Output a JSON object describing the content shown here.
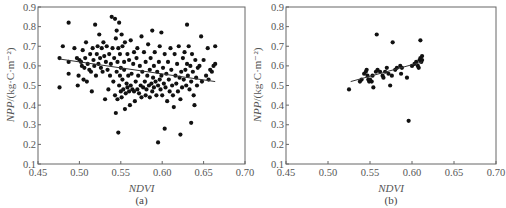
{
  "chart_data": [
    {
      "type": "scatter",
      "panel_label": "(a)",
      "xlabel": "NDVI",
      "ylabel_italic": "NPP",
      "ylabel_rest": "/(kg·C·m⁻²)",
      "xlim": [
        0.45,
        0.7
      ],
      "ylim": [
        0.1,
        0.9
      ],
      "xticks": [
        "0.45",
        "0.50",
        "0.55",
        "0.60",
        "0.65",
        "0.70"
      ],
      "yticks": [
        "0.1",
        "0.2",
        "0.3",
        "0.4",
        "0.5",
        "0.6",
        "0.7",
        "0.8",
        "0.9"
      ],
      "grid": false,
      "trendline": {
        "x": [
          0.476,
          0.664
        ],
        "y": [
          0.635,
          0.52
        ]
      },
      "points": [
        [
          0.476,
          0.64
        ],
        [
          0.476,
          0.49
        ],
        [
          0.48,
          0.7
        ],
        [
          0.487,
          0.82
        ],
        [
          0.487,
          0.62
        ],
        [
          0.487,
          0.56
        ],
        [
          0.494,
          0.69
        ],
        [
          0.497,
          0.64
        ],
        [
          0.498,
          0.5
        ],
        [
          0.499,
          0.55
        ],
        [
          0.5,
          0.63
        ],
        [
          0.502,
          0.62
        ],
        [
          0.503,
          0.6
        ],
        [
          0.504,
          0.68
        ],
        [
          0.505,
          0.53
        ],
        [
          0.506,
          0.59
        ],
        [
          0.507,
          0.64
        ],
        [
          0.508,
          0.72
        ],
        [
          0.509,
          0.52
        ],
        [
          0.51,
          0.61
        ],
        [
          0.512,
          0.58
        ],
        [
          0.513,
          0.66
        ],
        [
          0.514,
          0.57
        ],
        [
          0.515,
          0.47
        ],
        [
          0.516,
          0.69
        ],
        [
          0.517,
          0.63
        ],
        [
          0.518,
          0.6
        ],
        [
          0.519,
          0.81
        ],
        [
          0.52,
          0.55
        ],
        [
          0.521,
          0.66
        ],
        [
          0.522,
          0.7
        ],
        [
          0.523,
          0.61
        ],
        [
          0.524,
          0.76
        ],
        [
          0.525,
          0.64
        ],
        [
          0.526,
          0.59
        ],
        [
          0.527,
          0.69
        ],
        [
          0.528,
          0.57
        ],
        [
          0.529,
          0.72
        ],
        [
          0.53,
          0.65
        ],
        [
          0.531,
          0.43
        ],
        [
          0.532,
          0.62
        ],
        [
          0.533,
          0.7
        ],
        [
          0.534,
          0.58
        ],
        [
          0.535,
          0.48
        ],
        [
          0.536,
          0.66
        ],
        [
          0.537,
          0.55
        ],
        [
          0.538,
          0.61
        ],
        [
          0.539,
          0.85
        ],
        [
          0.54,
          0.69
        ],
        [
          0.541,
          0.52
        ],
        [
          0.542,
          0.64
        ],
        [
          0.543,
          0.84
        ],
        [
          0.543,
          0.45
        ],
        [
          0.544,
          0.36
        ],
        [
          0.544,
          0.74
        ],
        [
          0.545,
          0.57
        ],
        [
          0.545,
          0.78
        ],
        [
          0.546,
          0.62
        ],
        [
          0.546,
          0.43
        ],
        [
          0.547,
          0.26
        ],
        [
          0.547,
          0.69
        ],
        [
          0.548,
          0.82
        ],
        [
          0.548,
          0.5
        ],
        [
          0.549,
          0.55
        ],
        [
          0.549,
          0.66
        ],
        [
          0.55,
          0.59
        ],
        [
          0.55,
          0.47
        ],
        [
          0.551,
          0.76
        ],
        [
          0.551,
          0.44
        ],
        [
          0.552,
          0.53
        ],
        [
          0.552,
          0.7
        ],
        [
          0.553,
          0.48
        ],
        [
          0.554,
          0.62
        ],
        [
          0.554,
          0.58
        ],
        [
          0.555,
          0.38
        ],
        [
          0.555,
          0.72
        ],
        [
          0.556,
          0.46
        ],
        [
          0.557,
          0.51
        ],
        [
          0.558,
          0.66
        ],
        [
          0.558,
          0.49
        ],
        [
          0.559,
          0.55
        ],
        [
          0.56,
          0.63
        ],
        [
          0.56,
          0.47
        ],
        [
          0.561,
          0.4
        ],
        [
          0.562,
          0.73
        ],
        [
          0.562,
          0.5
        ],
        [
          0.563,
          0.56
        ],
        [
          0.564,
          0.48
        ],
        [
          0.565,
          0.61
        ],
        [
          0.566,
          0.67
        ],
        [
          0.566,
          0.47
        ],
        [
          0.567,
          0.42
        ],
        [
          0.568,
          0.52
        ],
        [
          0.569,
          0.64
        ],
        [
          0.57,
          0.48
        ],
        [
          0.57,
          0.69
        ],
        [
          0.571,
          0.55
        ],
        [
          0.572,
          0.46
        ],
        [
          0.573,
          0.6
        ],
        [
          0.574,
          0.5
        ],
        [
          0.575,
          0.75
        ],
        [
          0.575,
          0.44
        ],
        [
          0.576,
          0.57
        ],
        [
          0.577,
          0.49
        ],
        [
          0.578,
          0.67
        ],
        [
          0.579,
          0.52
        ],
        [
          0.58,
          0.62
        ],
        [
          0.58,
          0.45
        ],
        [
          0.581,
          0.48
        ],
        [
          0.582,
          0.55
        ],
        [
          0.583,
          0.71
        ],
        [
          0.584,
          0.5
        ],
        [
          0.585,
          0.58
        ],
        [
          0.585,
          0.44
        ],
        [
          0.586,
          0.64
        ],
        [
          0.587,
          0.51
        ],
        [
          0.588,
          0.78
        ],
        [
          0.588,
          0.47
        ],
        [
          0.589,
          0.54
        ],
        [
          0.59,
          0.6
        ],
        [
          0.59,
          0.49
        ],
        [
          0.591,
          0.67
        ],
        [
          0.592,
          0.52
        ],
        [
          0.593,
          0.45
        ],
        [
          0.594,
          0.57
        ],
        [
          0.595,
          0.21
        ],
        [
          0.595,
          0.5
        ],
        [
          0.596,
          0.62
        ],
        [
          0.597,
          0.53
        ],
        [
          0.597,
          0.7
        ],
        [
          0.598,
          0.48
        ],
        [
          0.599,
          0.77
        ],
        [
          0.599,
          0.55
        ],
        [
          0.6,
          0.45
        ],
        [
          0.601,
          0.59
        ],
        [
          0.602,
          0.51
        ],
        [
          0.603,
          0.28
        ],
        [
          0.603,
          0.66
        ],
        [
          0.604,
          0.49
        ],
        [
          0.605,
          0.56
        ],
        [
          0.606,
          0.42
        ],
        [
          0.607,
          0.62
        ],
        [
          0.608,
          0.53
        ],
        [
          0.609,
          0.47
        ],
        [
          0.61,
          0.69
        ],
        [
          0.611,
          0.58
        ],
        [
          0.612,
          0.5
        ],
        [
          0.613,
          0.45
        ],
        [
          0.614,
          0.39
        ],
        [
          0.615,
          0.66
        ],
        [
          0.616,
          0.55
        ],
        [
          0.617,
          0.51
        ],
        [
          0.618,
          0.61
        ],
        [
          0.619,
          0.47
        ],
        [
          0.62,
          0.7
        ],
        [
          0.621,
          0.54
        ],
        [
          0.622,
          0.25
        ],
        [
          0.622,
          0.43
        ],
        [
          0.623,
          0.57
        ],
        [
          0.624,
          0.49
        ],
        [
          0.625,
          0.64
        ],
        [
          0.626,
          0.53
        ],
        [
          0.627,
          0.67
        ],
        [
          0.628,
          0.58
        ],
        [
          0.629,
          0.5
        ],
        [
          0.63,
          0.81
        ],
        [
          0.63,
          0.61
        ],
        [
          0.631,
          0.55
        ],
        [
          0.632,
          0.7
        ],
        [
          0.633,
          0.48
        ],
        [
          0.634,
          0.6
        ],
        [
          0.635,
          0.31
        ],
        [
          0.635,
          0.52
        ],
        [
          0.636,
          0.66
        ],
        [
          0.637,
          0.57
        ],
        [
          0.638,
          0.45
        ],
        [
          0.639,
          0.4
        ],
        [
          0.64,
          0.63
        ],
        [
          0.641,
          0.54
        ],
        [
          0.642,
          0.5
        ],
        [
          0.643,
          0.59
        ],
        [
          0.645,
          0.6
        ],
        [
          0.647,
          0.75
        ],
        [
          0.648,
          0.52
        ],
        [
          0.65,
          0.63
        ],
        [
          0.653,
          0.55
        ],
        [
          0.655,
          0.69
        ],
        [
          0.656,
          0.53
        ],
        [
          0.658,
          0.58
        ],
        [
          0.66,
          0.57
        ],
        [
          0.662,
          0.6
        ],
        [
          0.664,
          0.7
        ],
        [
          0.664,
          0.61
        ]
      ]
    },
    {
      "type": "scatter",
      "panel_label": "(b)",
      "xlabel": "NDVI",
      "ylabel_italic": "NPP",
      "ylabel_rest": "/(kg·C·m⁻²)",
      "xlim": [
        0.45,
        0.7
      ],
      "ylim": [
        0.1,
        0.9
      ],
      "xticks": [
        "0.45",
        "0.50",
        "0.55",
        "0.60",
        "0.65",
        "0.70"
      ],
      "yticks": [
        "0.1",
        "0.2",
        "0.3",
        "0.4",
        "0.5",
        "0.6",
        "0.7",
        "0.8",
        "0.9"
      ],
      "grid": false,
      "trendline": {
        "x": [
          0.527,
          0.612
        ],
        "y": [
          0.52,
          0.62
        ]
      },
      "points": [
        [
          0.525,
          0.48
        ],
        [
          0.538,
          0.52
        ],
        [
          0.54,
          0.53
        ],
        [
          0.543,
          0.56
        ],
        [
          0.545,
          0.57
        ],
        [
          0.546,
          0.58
        ],
        [
          0.547,
          0.55
        ],
        [
          0.548,
          0.53
        ],
        [
          0.549,
          0.52
        ],
        [
          0.55,
          0.53
        ],
        [
          0.552,
          0.52
        ],
        [
          0.553,
          0.55
        ],
        [
          0.554,
          0.49
        ],
        [
          0.557,
          0.57
        ],
        [
          0.558,
          0.76
        ],
        [
          0.559,
          0.58
        ],
        [
          0.562,
          0.57
        ],
        [
          0.565,
          0.55
        ],
        [
          0.566,
          0.54
        ],
        [
          0.568,
          0.57
        ],
        [
          0.57,
          0.59
        ],
        [
          0.572,
          0.56
        ],
        [
          0.574,
          0.5
        ],
        [
          0.576,
          0.55
        ],
        [
          0.577,
          0.72
        ],
        [
          0.58,
          0.58
        ],
        [
          0.582,
          0.59
        ],
        [
          0.586,
          0.6
        ],
        [
          0.587,
          0.56
        ],
        [
          0.588,
          0.59
        ],
        [
          0.594,
          0.54
        ],
        [
          0.596,
          0.32
        ],
        [
          0.6,
          0.6
        ],
        [
          0.603,
          0.61
        ],
        [
          0.605,
          0.62
        ],
        [
          0.607,
          0.6
        ],
        [
          0.608,
          0.59
        ],
        [
          0.609,
          0.63
        ],
        [
          0.61,
          0.73
        ],
        [
          0.61,
          0.64
        ],
        [
          0.611,
          0.62
        ],
        [
          0.612,
          0.65
        ],
        [
          0.612,
          0.63
        ]
      ]
    }
  ]
}
